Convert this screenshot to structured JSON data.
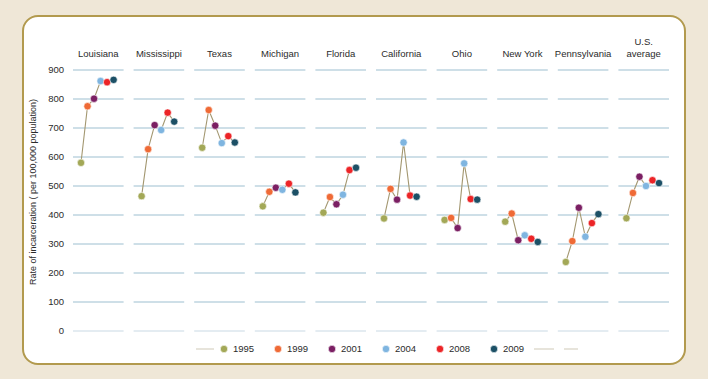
{
  "figure": {
    "background_color": "#efe7d7",
    "frame_color": "#b29a4e",
    "plot_background": "#ffffff"
  },
  "chart_data": {
    "type": "scatter",
    "title": "",
    "xlabel": "",
    "ylabel": "Rate of incarceration ( per 100,000 population)",
    "ylim": [
      0,
      900
    ],
    "yticks": [
      0,
      100,
      200,
      300,
      400,
      500,
      600,
      700,
      800,
      900
    ],
    "grid": true,
    "legend_position": "bottom",
    "series_colors": {
      "1995": "#a3a857",
      "1999": "#ef6a36",
      "2001": "#7b1f63",
      "2004": "#7fb5e0",
      "2008": "#ec2427",
      "2009": "#1c5066"
    },
    "legend": [
      {
        "label": "1995",
        "color": "#a3a857"
      },
      {
        "label": "1999",
        "color": "#ef6a36"
      },
      {
        "label": "2001",
        "color": "#7b1f63"
      },
      {
        "label": "2004",
        "color": "#7fb5e0"
      },
      {
        "label": "2008",
        "color": "#ec2427"
      },
      {
        "label": "2009",
        "color": "#1c5066"
      }
    ],
    "years": [
      "1995",
      "1999",
      "2001",
      "2004",
      "2008",
      "2009"
    ],
    "categories": [
      "Louisiana",
      "Mississippi",
      "Texas",
      "Michigan",
      "Florida",
      "California",
      "Ohio",
      "New York",
      "Pennsylvania",
      "U.S. average"
    ],
    "panels": [
      {
        "name": "Louisiana",
        "values": [
          580,
          775,
          801,
          862,
          858,
          866
        ]
      },
      {
        "name": "Mississippi",
        "values": [
          465,
          627,
          710,
          693,
          753,
          722
        ]
      },
      {
        "name": "Texas",
        "values": [
          632,
          762,
          708,
          648,
          672,
          650
        ]
      },
      {
        "name": "Michigan",
        "values": [
          430,
          480,
          494,
          487,
          508,
          478
        ]
      },
      {
        "name": "Florida",
        "values": [
          408,
          462,
          437,
          470,
          555,
          563
        ]
      },
      {
        "name": "California",
        "values": [
          388,
          490,
          453,
          650,
          467,
          463
        ]
      },
      {
        "name": "Ohio",
        "values": [
          383,
          390,
          355,
          578,
          455,
          453
        ]
      },
      {
        "name": "New York",
        "values": [
          377,
          405,
          313,
          330,
          318,
          307
        ]
      },
      {
        "name": "Pennsylvania",
        "values": [
          238,
          310,
          425,
          325,
          372,
          403
        ]
      },
      {
        "name": "U.S. average",
        "values": [
          389,
          476,
          532,
          500,
          520,
          510
        ]
      }
    ]
  }
}
